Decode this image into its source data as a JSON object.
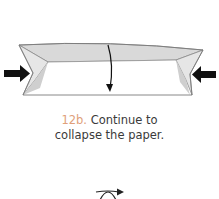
{
  "step": {
    "number": "12b.",
    "text_line1": "Continue to",
    "text_line2": "collapse the paper."
  },
  "icons": {
    "left_arrow": "push-arrow-right-icon",
    "right_arrow": "push-arrow-left-icon",
    "fold_arrow": "fold-down-arrow-icon",
    "symbol": "turn-over-icon"
  },
  "colors": {
    "step_number": "#e0a07a",
    "paper_shade": "#d9d9d9",
    "paper_white": "#ffffff",
    "outline": "#7a7a7a",
    "arrow": "#111111",
    "text": "#3a3a3a"
  }
}
